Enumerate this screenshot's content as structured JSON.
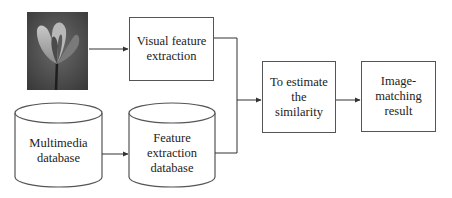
{
  "diagram": {
    "type": "flowchart",
    "nodes": {
      "query_image": {
        "label": "",
        "kind": "image",
        "description": "grayscale flower photo"
      },
      "visual_feature": {
        "label": "Visual feature extraction",
        "lines": [
          "Visual feature",
          "extraction"
        ],
        "kind": "box"
      },
      "multimedia_db": {
        "label": "Multimedia database",
        "lines": [
          "Multimedia",
          "database"
        ],
        "kind": "cylinder"
      },
      "feature_db": {
        "label": "Feature extraction database",
        "lines": [
          "Feature",
          "extraction",
          "database"
        ],
        "kind": "cylinder"
      },
      "similarity": {
        "label": "To estimate the similarity",
        "lines": [
          "To estimate",
          "the",
          "similarity"
        ],
        "kind": "box"
      },
      "result": {
        "label": "Image-matching result",
        "lines": [
          "Image-",
          "matching",
          "result"
        ],
        "kind": "box"
      }
    },
    "edges": [
      {
        "from": "query_image",
        "to": "visual_feature"
      },
      {
        "from": "multimedia_db",
        "to": "feature_db"
      },
      {
        "from": "visual_feature",
        "to": "similarity"
      },
      {
        "from": "feature_db",
        "to": "similarity"
      },
      {
        "from": "similarity",
        "to": "result"
      }
    ],
    "colors": {
      "stroke": "#555555",
      "text": "#222222",
      "background": "#ffffff"
    }
  }
}
